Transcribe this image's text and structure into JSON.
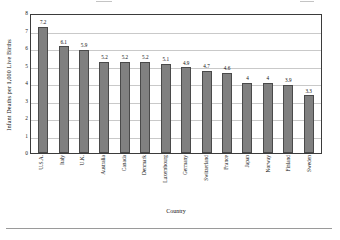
{
  "chart_data": {
    "type": "bar",
    "title": "",
    "xlabel": "Country",
    "ylabel": "Infant Deaths per 1,000 Live Births",
    "categories": [
      "U.S.A.",
      "Italy",
      "U.K.",
      "Australia",
      "Canada",
      "Denmark",
      "Luxembourg",
      "Germany",
      "Switzerland",
      "France",
      "Japan",
      "Norway",
      "Finland",
      "Sweden"
    ],
    "values": [
      7.2,
      6.1,
      5.9,
      5.2,
      5.2,
      5.2,
      5.1,
      4.9,
      4.7,
      4.6,
      4,
      4,
      3.9,
      3.3
    ],
    "value_labels": [
      "7.2",
      "6.1",
      "5.9",
      "5.2",
      "5.2",
      "5.2",
      "5.1",
      "4.9",
      "4.7",
      "4.6",
      "4",
      "4",
      "3.9",
      "3.3"
    ],
    "ylim": [
      0,
      8
    ],
    "yticks": [
      0,
      1,
      2,
      3,
      4,
      5,
      6,
      7,
      8
    ],
    "ytick_labels": [
      "0",
      "1",
      "2",
      "3",
      "4",
      "5",
      "6",
      "7",
      "8"
    ],
    "grid": true,
    "grid_axis": "y",
    "legend": false,
    "bar_fill_color": "#808080",
    "bar_border_color": "#4a4a4a",
    "plot_border_color": "#3b3b3b",
    "gridline_color": "#c9c9c9",
    "background_color": "#ffffff"
  }
}
